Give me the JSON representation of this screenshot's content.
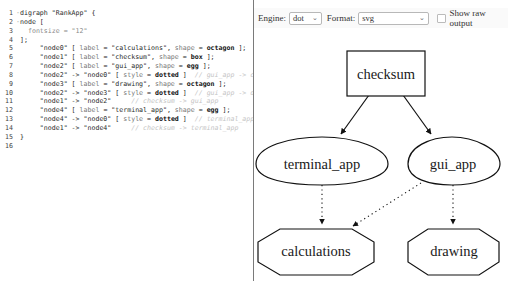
{
  "editor": {
    "lines": [
      {
        "n": "1",
        "fold": true,
        "segments": [
          {
            "t": "digraph \"RankApp\" {",
            "c": "txt"
          }
        ]
      },
      {
        "n": "2",
        "fold": true,
        "segments": [
          {
            "t": "node [",
            "c": "txt"
          }
        ]
      },
      {
        "n": "3",
        "fold": false,
        "segments": [
          {
            "t": "  fontsize = \"12\"",
            "c": "prop"
          }
        ]
      },
      {
        "n": "4",
        "fold": false,
        "segments": [
          {
            "t": "];",
            "c": "txt"
          }
        ]
      },
      {
        "n": "5",
        "fold": false,
        "segments": [
          {
            "t": "     \"node0\" [ ",
            "c": "txt"
          },
          {
            "t": "label",
            "c": "lbl"
          },
          {
            "t": " = \"calculations\", ",
            "c": "txt"
          },
          {
            "t": "shape",
            "c": "lbl"
          },
          {
            "t": " = ",
            "c": "txt"
          },
          {
            "t": "octagon",
            "c": "bold"
          },
          {
            "t": " ];",
            "c": "txt"
          }
        ]
      },
      {
        "n": "6",
        "fold": false,
        "segments": [
          {
            "t": "     \"node1\" [ ",
            "c": "txt"
          },
          {
            "t": "label",
            "c": "lbl"
          },
          {
            "t": " = \"checksum\", ",
            "c": "txt"
          },
          {
            "t": "shape",
            "c": "lbl"
          },
          {
            "t": " = ",
            "c": "txt"
          },
          {
            "t": "box",
            "c": "bold"
          },
          {
            "t": " ];",
            "c": "txt"
          }
        ]
      },
      {
        "n": "7",
        "fold": false,
        "segments": [
          {
            "t": "     \"node2\" [ ",
            "c": "txt"
          },
          {
            "t": "label",
            "c": "lbl"
          },
          {
            "t": " = \"gui_app\", ",
            "c": "txt"
          },
          {
            "t": "shape",
            "c": "lbl"
          },
          {
            "t": " = ",
            "c": "txt"
          },
          {
            "t": "egg",
            "c": "bold"
          },
          {
            "t": " ];",
            "c": "txt"
          }
        ]
      },
      {
        "n": "8",
        "fold": false,
        "segments": [
          {
            "t": "     \"node2\" -> \"node0\" [ ",
            "c": "txt"
          },
          {
            "t": "style",
            "c": "lbl"
          },
          {
            "t": " = ",
            "c": "txt"
          },
          {
            "t": "dotted",
            "c": "bold"
          },
          {
            "t": " ]",
            "c": "txt"
          },
          {
            "t": "  // gui_app -> calculations",
            "c": "comment"
          }
        ]
      },
      {
        "n": "9",
        "fold": false,
        "segments": [
          {
            "t": "     \"node3\" [ ",
            "c": "txt"
          },
          {
            "t": "label",
            "c": "lbl"
          },
          {
            "t": " = \"drawing\", ",
            "c": "txt"
          },
          {
            "t": "shape",
            "c": "lbl"
          },
          {
            "t": " = ",
            "c": "txt"
          },
          {
            "t": "octagon",
            "c": "bold"
          },
          {
            "t": " ];",
            "c": "txt"
          }
        ]
      },
      {
        "n": "10",
        "fold": false,
        "segments": [
          {
            "t": "     \"node2\" -> \"node3\" [ ",
            "c": "txt"
          },
          {
            "t": "style",
            "c": "lbl"
          },
          {
            "t": " = ",
            "c": "txt"
          },
          {
            "t": "dotted",
            "c": "bold"
          },
          {
            "t": " ]",
            "c": "txt"
          },
          {
            "t": "  // gui_app -> drawing",
            "c": "comment"
          }
        ]
      },
      {
        "n": "11",
        "fold": false,
        "segments": [
          {
            "t": "     \"node1\" -> \"node2\"",
            "c": "txt"
          },
          {
            "t": "     // checksum -> gui_app",
            "c": "comment"
          }
        ]
      },
      {
        "n": "12",
        "fold": false,
        "segments": [
          {
            "t": "     \"node4\" [ ",
            "c": "txt"
          },
          {
            "t": "label",
            "c": "lbl"
          },
          {
            "t": " = \"terminal_app\", ",
            "c": "txt"
          },
          {
            "t": "shape",
            "c": "lbl"
          },
          {
            "t": " = ",
            "c": "txt"
          },
          {
            "t": "egg",
            "c": "bold"
          },
          {
            "t": " ];",
            "c": "txt"
          }
        ]
      },
      {
        "n": "13",
        "fold": false,
        "segments": [
          {
            "t": "     \"node4\" -> \"node0\" [ ",
            "c": "txt"
          },
          {
            "t": "style",
            "c": "lbl"
          },
          {
            "t": " = ",
            "c": "txt"
          },
          {
            "t": "dotted",
            "c": "bold"
          },
          {
            "t": " ]",
            "c": "txt"
          },
          {
            "t": "  // terminal_app -> calculations",
            "c": "comment"
          }
        ]
      },
      {
        "n": "14",
        "fold": false,
        "segments": [
          {
            "t": "     \"node1\" -> \"node4\"",
            "c": "txt"
          },
          {
            "t": "     // checksum -> terminal_app",
            "c": "comment"
          }
        ]
      },
      {
        "n": "15",
        "fold": false,
        "segments": [
          {
            "t": "}",
            "c": "txt"
          }
        ]
      },
      {
        "n": "16",
        "fold": false,
        "segments": [
          {
            "t": "",
            "c": "txt"
          }
        ]
      }
    ]
  },
  "toolbar": {
    "engine_label": "Engine:",
    "engine_value": "dot",
    "format_label": "Format:",
    "format_value": "svg",
    "show_raw_label": "Show raw output",
    "show_raw_checked": false
  },
  "graph": {
    "nodes": {
      "checksum": {
        "label": "checksum",
        "shape": "box"
      },
      "terminal_app": {
        "label": "terminal_app",
        "shape": "egg"
      },
      "gui_app": {
        "label": "gui_app",
        "shape": "egg"
      },
      "calculations": {
        "label": "calculations",
        "shape": "octagon"
      },
      "drawing": {
        "label": "drawing",
        "shape": "octagon"
      }
    },
    "edges": [
      {
        "from": "checksum",
        "to": "terminal_app",
        "style": "solid"
      },
      {
        "from": "checksum",
        "to": "gui_app",
        "style": "solid"
      },
      {
        "from": "terminal_app",
        "to": "calculations",
        "style": "dotted"
      },
      {
        "from": "gui_app",
        "to": "calculations",
        "style": "dotted"
      },
      {
        "from": "gui_app",
        "to": "drawing",
        "style": "dotted"
      }
    ]
  }
}
